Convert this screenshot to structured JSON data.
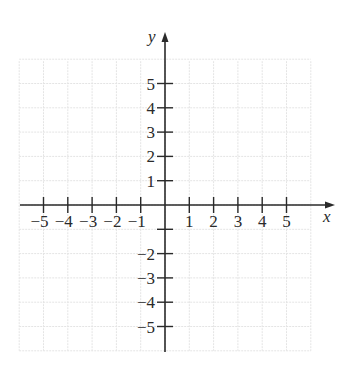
{
  "chart_data": {
    "type": "scatter",
    "title": "",
    "xlabel": "x",
    "ylabel": "y",
    "xlim": [
      -6,
      6
    ],
    "ylim": [
      -6,
      6
    ],
    "grid": true,
    "x_ticks": [
      -5,
      -4,
      -3,
      -2,
      -1,
      1,
      2,
      3,
      4,
      5
    ],
    "x_tick_labels": [
      "−5",
      "−4",
      "−3",
      "−2",
      "−1",
      "1",
      "2",
      "3",
      "4",
      "5"
    ],
    "y_ticks": [
      5,
      4,
      3,
      2,
      1,
      -1,
      -2,
      -3,
      -4,
      -5
    ],
    "y_tick_labels": [
      "5",
      "4",
      "3",
      "2",
      "1",
      "",
      "−2",
      "−3",
      "−4",
      "−5"
    ],
    "series": [],
    "legend": null
  },
  "colors": {
    "axis": "#2a2a2a",
    "grid": "#e4e4e4",
    "background": "#ffffff"
  }
}
